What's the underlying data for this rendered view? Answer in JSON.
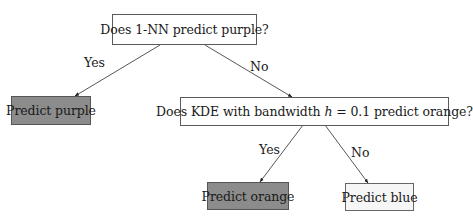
{
  "diagram": {
    "type": "decision-tree",
    "nodes": {
      "root": {
        "label": "Does 1-NN predict purple?"
      },
      "leaf_purple": {
        "label": "Predict purple"
      },
      "q2": {
        "label_pre": "Does KDE with bandwidth ",
        "label_var": "h",
        "label_post": " = 0.1 predict orange?"
      },
      "leaf_orange": {
        "label": "Predict orange"
      },
      "leaf_blue": {
        "label": "Predict blue"
      }
    },
    "edges": {
      "root_yes": {
        "label": "Yes"
      },
      "root_no": {
        "label": "No"
      },
      "q2_yes": {
        "label": "Yes"
      },
      "q2_no": {
        "label": "No"
      }
    },
    "colors": {
      "leaf_gray_fill": "#8c8c8c",
      "leaf_light_fill": "#f6f6f6",
      "question_fill": "#ffffff",
      "line": "#444444"
    }
  }
}
